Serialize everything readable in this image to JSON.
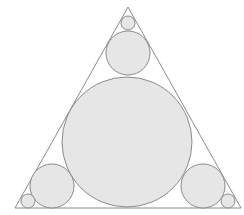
{
  "diagram": {
    "type": "triangle-inscribed-circles",
    "colors": {
      "background": "#ffffff",
      "stroke": "#8a8a8a",
      "fill": "#e6e6e6"
    },
    "triangle": {
      "points": [
        [
          128,
          7
        ],
        [
          15,
          208
        ],
        [
          241,
          208
        ]
      ]
    },
    "circles": [
      {
        "name": "incircle",
        "cx": 127,
        "cy": 142,
        "r": 65
      },
      {
        "name": "top-medium",
        "cx": 128,
        "cy": 53,
        "r": 22
      },
      {
        "name": "top-small",
        "cx": 128,
        "cy": 23,
        "r": 7
      },
      {
        "name": "bottom-left-medium",
        "cx": 52,
        "cy": 186,
        "r": 22
      },
      {
        "name": "bottom-left-small",
        "cx": 28,
        "cy": 201,
        "r": 7
      },
      {
        "name": "bottom-right-medium",
        "cx": 203,
        "cy": 186,
        "r": 22
      },
      {
        "name": "bottom-right-small",
        "cx": 228,
        "cy": 201,
        "r": 7
      }
    ]
  }
}
